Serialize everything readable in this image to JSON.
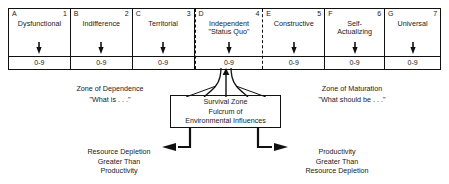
{
  "diagram": {
    "colors": {
      "line": "#111111",
      "text": "#1a1a1a",
      "background": "#ffffff"
    },
    "scale_cells": [
      {
        "letter": "A",
        "number": "1",
        "title": "Dysfunctional",
        "range": "0-9",
        "dashed": false
      },
      {
        "letter": "B",
        "number": "2",
        "title": "Indifference",
        "range": "0-9",
        "dashed": false
      },
      {
        "letter": "C",
        "number": "3",
        "title": "Territorial",
        "range": "0-9",
        "dashed": false
      },
      {
        "letter": "D",
        "number": "4",
        "title": "Independent\n\"Status Quo\"",
        "range": "0-9",
        "dashed": true
      },
      {
        "letter": "E",
        "number": "5",
        "title": "Constructive",
        "range": "0-9",
        "dashed": false
      },
      {
        "letter": "F",
        "number": "6",
        "title": "Self-\nActualizing",
        "range": "0-9",
        "dashed": false
      },
      {
        "letter": "G",
        "number": "7",
        "title": "Universal",
        "range": "0-9",
        "dashed": false
      }
    ],
    "zone_left": {
      "name": "Zone of Dependence",
      "question": "\"What is . . .\""
    },
    "zone_right": {
      "name": "Zone of Maturation",
      "question": "\"What should be . . .\""
    },
    "survival_box": {
      "line1": "Survival Zone",
      "line2": "Fulcrum of",
      "line3": "Environmental Influences"
    },
    "branch_left": {
      "text": "Resource Depletion\nGreater Than\nProductivity"
    },
    "branch_right": {
      "text": "Productivity\nGreater Than\nResource Depletion"
    },
    "icons": {
      "cell_arrow": "arrow-down-icon",
      "neck": "pinch-connector-icon",
      "branch": "branch-arrows-icon"
    }
  }
}
